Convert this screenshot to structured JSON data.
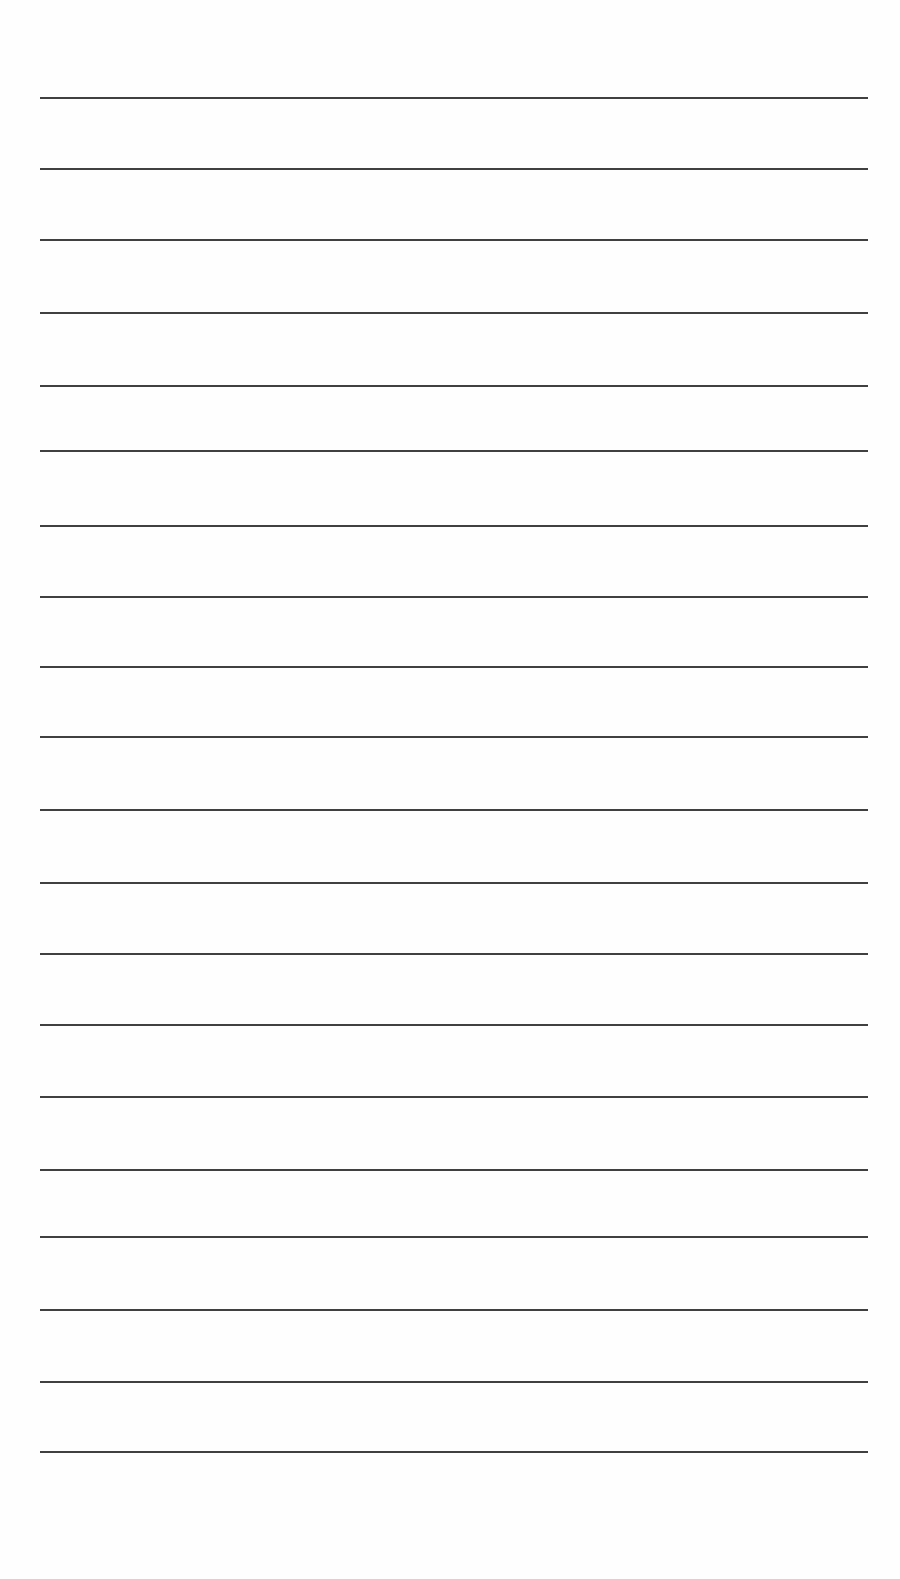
{
  "page": {
    "type": "lined-paper",
    "background_color": "#fefefe",
    "line_color": "#2b2b2b",
    "line_left_x": 40,
    "line_right_x": 868,
    "line_thickness": 2,
    "line_y_positions": [
      97,
      168,
      239,
      312,
      385,
      450,
      525,
      596,
      666,
      736,
      809,
      882,
      953,
      1024,
      1096,
      1169,
      1236,
      1309,
      1381,
      1451
    ],
    "line_count": 20
  }
}
